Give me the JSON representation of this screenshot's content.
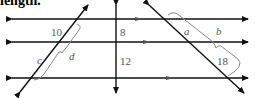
{
  "title_fragment": "length.",
  "labels": {
    "seg_10": "10",
    "seg_c": "c",
    "seg_d": "d",
    "seg_8": "8",
    "seg_12": "12",
    "seg_a": "a",
    "seg_b": "b",
    "seg_18": "18"
  },
  "colors": {
    "line": "#111111",
    "arrow_mark": "#444444",
    "brace": "#888888",
    "label": "#555555"
  }
}
